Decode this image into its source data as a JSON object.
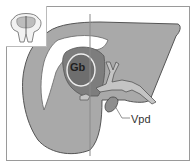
{
  "diagram": {
    "type": "anatomical-illustration",
    "labels": {
      "gallbladder": "Gb",
      "vein": "Vpd"
    },
    "inset": {
      "description": "orientation thumbnail of abdominal cross-section"
    },
    "colors": {
      "background": "#ffffff",
      "liver": "#a9a9a9",
      "liver_dark": "#7d7d7d",
      "gallbladder": "#6e6e6e",
      "vessels": "#c4c4c4",
      "outline": "#555555",
      "frame": "#9a9a9a",
      "plane_line": "#8a8a8a"
    }
  }
}
